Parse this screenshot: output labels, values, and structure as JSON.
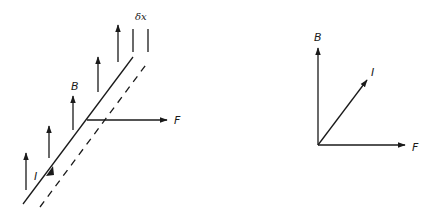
{
  "colors": {
    "ink": "#1a1a1a",
    "background": "#ffffff"
  },
  "left_diagram": {
    "labels": {
      "field": "B",
      "current": "I",
      "force": "F",
      "displacement": "δx"
    },
    "field_arrow_count": 5,
    "wire_solid": "conductor",
    "wire_dashed": "displaced conductor"
  },
  "right_diagram": {
    "labels": {
      "field": "B",
      "current": "I",
      "force": "F"
    }
  }
}
